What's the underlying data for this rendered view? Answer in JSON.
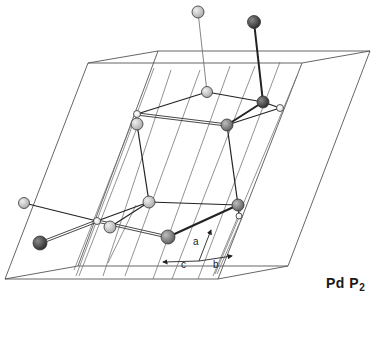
{
  "compound_label": {
    "main": "Pd P",
    "sub": "2"
  },
  "axes": {
    "origin": [
      199,
      261
    ],
    "a": {
      "label": "a",
      "tip": [
        211,
        230
      ],
      "label_pos": [
        193,
        245
      ]
    },
    "b": {
      "label": "b",
      "tip": [
        232,
        256
      ],
      "label_pos": [
        213,
        268
      ]
    },
    "c": {
      "label": "c",
      "tip": [
        163,
        262
      ],
      "label_pos": [
        181,
        268
      ]
    }
  },
  "colors": {
    "line": "#555555",
    "bond_dark": "#222222",
    "atom_dark": "#4a4a4a",
    "atom_mid": "#8c8c8c",
    "atom_light": "#c9c9c9",
    "atom_white": "#ffffff"
  },
  "unit_cell": {
    "edges": [
      [
        [
          88,
          63
        ],
        [
          302,
          63
        ]
      ],
      [
        [
          302,
          63
        ],
        [
          218,
          279
        ]
      ],
      [
        [
          218,
          279
        ],
        [
          5,
          279
        ]
      ],
      [
        [
          5,
          279
        ],
        [
          88,
          63
        ]
      ],
      [
        [
          158,
          51
        ],
        [
          370,
          51
        ]
      ],
      [
        [
          370,
          51
        ],
        [
          288,
          266
        ]
      ],
      [
        [
          288,
          266
        ],
        [
          78,
          266
        ]
      ],
      [
        [
          78,
          266
        ],
        [
          158,
          51
        ]
      ],
      [
        [
          88,
          63
        ],
        [
          158,
          51
        ]
      ],
      [
        [
          302,
          63
        ],
        [
          370,
          51
        ]
      ],
      [
        [
          218,
          279
        ],
        [
          288,
          266
        ]
      ],
      [
        [
          5,
          279
        ],
        [
          78,
          266
        ]
      ]
    ],
    "inner_lines": [
      [
        [
          154,
          68
        ],
        [
          76,
          276
        ]
      ],
      [
        [
          140,
          120
        ],
        [
          79,
          276
        ]
      ],
      [
        [
          133,
          120
        ],
        [
          74,
          270
        ]
      ],
      [
        [
          171,
          70
        ],
        [
          103,
          276
        ]
      ],
      [
        [
          200,
          70
        ],
        [
          125,
          276
        ]
      ],
      [
        [
          230,
          66
        ],
        [
          153,
          279
        ]
      ],
      [
        [
          255,
          66
        ],
        [
          172,
          279
        ]
      ],
      [
        [
          280,
          62
        ],
        [
          198,
          279
        ]
      ],
      [
        [
          297,
          76
        ],
        [
          213,
          276
        ]
      ],
      [
        [
          240,
          215
        ],
        [
          215,
          274
        ]
      ],
      [
        [
          243,
          215
        ],
        [
          217,
          274
        ]
      ],
      [
        [
          136,
          205
        ],
        [
          108,
          263
        ]
      ]
    ]
  },
  "bonds": [
    {
      "from": [
        198,
        12
      ],
      "to": [
        207,
        92
      ],
      "style": "thin"
    },
    {
      "from": [
        254,
        22
      ],
      "to": [
        263,
        102
      ],
      "style": "thick"
    },
    {
      "from": [
        207,
        92
      ],
      "to": [
        263,
        102
      ],
      "style": "normal"
    },
    {
      "from": [
        207,
        92
      ],
      "to": [
        137,
        114
      ],
      "style": "normal"
    },
    {
      "from": [
        137,
        114
      ],
      "to": [
        227,
        125
      ],
      "style": "double"
    },
    {
      "from": [
        263,
        102
      ],
      "to": [
        227,
        125
      ],
      "style": "thick"
    },
    {
      "from": [
        263,
        102
      ],
      "to": [
        280,
        108
      ],
      "style": "normal"
    },
    {
      "from": [
        280,
        108
      ],
      "to": [
        227,
        125
      ],
      "style": "normal"
    },
    {
      "from": [
        137,
        124
      ],
      "to": [
        149,
        202
      ],
      "style": "normal"
    },
    {
      "from": [
        227,
        125
      ],
      "to": [
        238,
        205
      ],
      "style": "normal"
    },
    {
      "from": [
        149,
        202
      ],
      "to": [
        238,
        205
      ],
      "style": "normal"
    },
    {
      "from": [
        149,
        202
      ],
      "to": [
        97,
        221
      ],
      "style": "normal"
    },
    {
      "from": [
        149,
        202
      ],
      "to": [
        110,
        227
      ],
      "style": "normal"
    },
    {
      "from": [
        24,
        203
      ],
      "to": [
        97,
        221
      ],
      "style": "normal"
    },
    {
      "from": [
        97,
        221
      ],
      "to": [
        168,
        237
      ],
      "style": "double"
    },
    {
      "from": [
        40,
        243
      ],
      "to": [
        97,
        221
      ],
      "style": "double"
    },
    {
      "from": [
        168,
        237
      ],
      "to": [
        238,
        205
      ],
      "style": "thick"
    },
    {
      "from": [
        238,
        205
      ],
      "to": [
        239,
        216
      ],
      "style": "normal"
    }
  ],
  "atoms": [
    {
      "id": "top-light",
      "x": 198,
      "y": 12,
      "r": 6,
      "tone": "light"
    },
    {
      "id": "top-dark",
      "x": 254,
      "y": 22,
      "r": 6.5,
      "tone": "dark"
    },
    {
      "id": "mid-light",
      "x": 207,
      "y": 92,
      "r": 5.5,
      "tone": "light"
    },
    {
      "id": "mid-dark-right",
      "x": 263,
      "y": 102,
      "r": 6,
      "tone": "dark"
    },
    {
      "id": "small-white-right",
      "x": 280,
      "y": 108,
      "r": 3.5,
      "tone": "white"
    },
    {
      "id": "left-light-upper",
      "x": 137,
      "y": 124,
      "r": 6,
      "tone": "light"
    },
    {
      "id": "small-white-left-upper",
      "x": 137,
      "y": 114,
      "r": 3.5,
      "tone": "white"
    },
    {
      "id": "mid-dark",
      "x": 227,
      "y": 125,
      "r": 6,
      "tone": "mid"
    },
    {
      "id": "lower-light",
      "x": 149,
      "y": 202,
      "r": 6,
      "tone": "light"
    },
    {
      "id": "lower-right-mid",
      "x": 238,
      "y": 205,
      "r": 6,
      "tone": "mid"
    },
    {
      "id": "small-white-lower-right",
      "x": 239,
      "y": 216,
      "r": 3,
      "tone": "white"
    },
    {
      "id": "far-left-light",
      "x": 24,
      "y": 203,
      "r": 5.5,
      "tone": "light"
    },
    {
      "id": "lower-light-center",
      "x": 110,
      "y": 227,
      "r": 6,
      "tone": "light"
    },
    {
      "id": "small-white-center",
      "x": 97,
      "y": 221,
      "r": 3.5,
      "tone": "white"
    },
    {
      "id": "left-dark",
      "x": 40,
      "y": 243,
      "r": 7,
      "tone": "dark"
    },
    {
      "id": "center-dark",
      "x": 168,
      "y": 237,
      "r": 7,
      "tone": "mid"
    }
  ]
}
